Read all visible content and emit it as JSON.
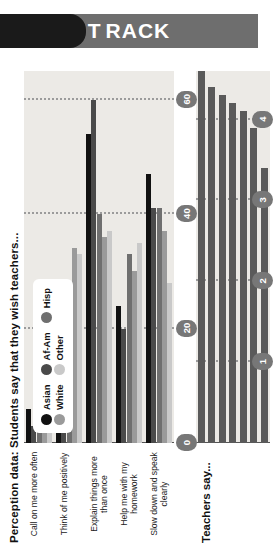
{
  "banner": {
    "text_first": "T",
    "text_rest": "RACK"
  },
  "chart_top": {
    "title": "Perception data: Students say that they wish teachers...",
    "legend": [
      {
        "label": "Asian",
        "color": "#111111"
      },
      {
        "label": "Af-Am",
        "color": "#4a4a4a"
      },
      {
        "label": "Hisp",
        "color": "#6f6f6f"
      },
      {
        "label": "White",
        "color": "#9a9a9a"
      },
      {
        "label": "Other",
        "color": "#c9c9c9"
      }
    ],
    "ticks": [
      "0",
      "20",
      "40",
      "60"
    ]
  },
  "chart_bottom": {
    "subtitle": "Teachers say...",
    "ticks": [
      "1",
      "2",
      "3",
      "4"
    ]
  },
  "chart_data": [
    {
      "type": "bar",
      "orientation": "horizontal-grouped",
      "title": "Perception data: Students say that they wish teachers...",
      "xlabel": "",
      "ylabel": "",
      "xlim": [
        0,
        65
      ],
      "grid": true,
      "legend_position": "inside-left",
      "xticks": [
        0,
        20,
        40,
        60
      ],
      "categories": [
        "Call on me more often",
        "Think of me positively",
        "Explain things more than once",
        "Help me with my homework",
        "Slow down and speak clearly"
      ],
      "series": [
        {
          "name": "Asian",
          "color": "#111111",
          "values": [
            6,
            20,
            54,
            24,
            47
          ]
        },
        {
          "name": "Af-Am",
          "color": "#4a4a4a",
          "values": [
            3,
            19,
            60,
            20,
            41
          ]
        },
        {
          "name": "Hisp",
          "color": "#6f6f6f",
          "values": [
            10,
            15,
            40,
            33,
            41
          ]
        },
        {
          "name": "White",
          "color": "#9a9a9a",
          "values": [
            9,
            34,
            36,
            30,
            37
          ]
        },
        {
          "name": "Other",
          "color": "#c9c9c9",
          "values": [
            4,
            33,
            37,
            35,
            28
          ]
        }
      ]
    },
    {
      "type": "bar",
      "orientation": "horizontal",
      "title": "Teachers say...",
      "xlabel": "",
      "ylabel": "",
      "xlim": [
        0,
        4.6
      ],
      "grid": true,
      "xticks": [
        1,
        2,
        3,
        4
      ],
      "categories": [
        "1",
        "2",
        "3",
        "4",
        "5",
        "6",
        "7"
      ],
      "values": [
        4.6,
        4.4,
        4.3,
        4.2,
        4.1,
        3.9,
        3.4
      ],
      "color": "#5a5a5a"
    }
  ]
}
